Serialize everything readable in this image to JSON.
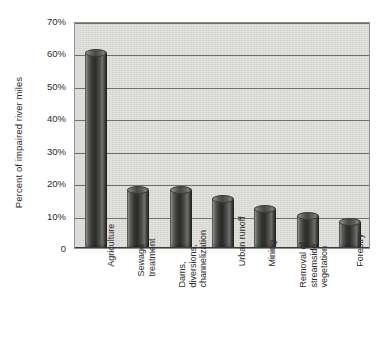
{
  "chart_data": {
    "type": "bar",
    "title": "",
    "subtitle": "",
    "xlabel": "",
    "ylabel": "Percent of impaired river miles",
    "ylim": [
      0,
      70
    ],
    "ytick_values": [
      70,
      60,
      50,
      40,
      30,
      20,
      10,
      0
    ],
    "ytick_labels": [
      "70%",
      "60%",
      "50%",
      "40%",
      "30%",
      "20%",
      "10%",
      "0"
    ],
    "grid": "horizontal",
    "legend": "none",
    "value_unit": "percent",
    "categories": [
      "Agriculture",
      "Sewage treatment",
      "Dams, diversions, channelization",
      "Urban runoff",
      "Mining",
      "Removal of streamside vegetation",
      "Forestry"
    ],
    "values": [
      60,
      18,
      18,
      15,
      12,
      10,
      8
    ],
    "series": [
      {
        "name": "Percent of impaired river miles",
        "values": [
          60,
          18,
          18,
          15,
          12,
          10,
          8
        ]
      }
    ],
    "bars": [
      {
        "category": "Agriculture",
        "value": 60,
        "label_lines": [
          "Agriculture"
        ]
      },
      {
        "category": "Sewage treatment",
        "value": 18,
        "label_lines": [
          "Sewage",
          "treatment"
        ]
      },
      {
        "category": "Dams, diversions, channelization",
        "value": 18,
        "label_lines": [
          "Dams,",
          "diversions,",
          "channelization"
        ]
      },
      {
        "category": "Urban runoff",
        "value": 15,
        "label_lines": [
          "Urban runoff"
        ]
      },
      {
        "category": "Mining",
        "value": 12,
        "label_lines": [
          "Mining"
        ]
      },
      {
        "category": "Removal of streamside vegetation",
        "value": 10,
        "label_lines": [
          "Removal of",
          "streamside",
          "vegetation"
        ]
      },
      {
        "category": "Forestry",
        "value": 8,
        "label_lines": [
          "Forestry"
        ]
      }
    ],
    "colors": {
      "plot_background": "#dcdcd8",
      "page_background": "#ffffff",
      "gridline": "#6e6e6a",
      "axis": "#3c3c3a",
      "bar_dark": "#2c2c2b",
      "bar_light": "#9a9a96",
      "text": "#2b2b2b"
    }
  }
}
